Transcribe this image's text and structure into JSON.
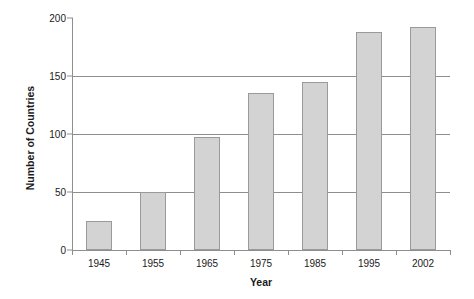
{
  "chart_data": {
    "type": "bar",
    "title": "",
    "xlabel": "Year",
    "ylabel": "Number of Countries",
    "categories": [
      "1945",
      "1955",
      "1965",
      "1975",
      "1985",
      "1995",
      "2002"
    ],
    "values": [
      25,
      50,
      97,
      135,
      145,
      188,
      192
    ],
    "ylim": [
      0,
      200
    ],
    "yticks": [
      0,
      50,
      100,
      150,
      200
    ],
    "ytick_labels": [
      "0",
      "50",
      "100",
      "150",
      "200"
    ],
    "grid": "horizontal",
    "legend": "none",
    "series": [
      {
        "name": "Number of Countries",
        "values": [
          25,
          50,
          97,
          135,
          145,
          188,
          192
        ]
      }
    ],
    "colors": {
      "bar_fill": "#d3d3d3",
      "bar_border": "#9a9a9a",
      "gridline": "#8e8e8e",
      "axis": "#8e8e8e",
      "text": "#1b1b1b",
      "background": "#ffffff"
    }
  }
}
